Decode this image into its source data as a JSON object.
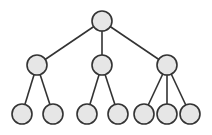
{
  "diagram": {
    "type": "tree",
    "style": {
      "node_fill": "#e6e6e6",
      "node_stroke": "#333333",
      "edge_color": "#333333",
      "background": "#ffffff",
      "node_radius": 10
    },
    "nodes": [
      {
        "id": "root",
        "level": 0,
        "cx": 102,
        "cy": 21
      },
      {
        "id": "a",
        "level": 1,
        "cx": 37,
        "cy": 65
      },
      {
        "id": "b",
        "level": 1,
        "cx": 102,
        "cy": 65
      },
      {
        "id": "c",
        "level": 1,
        "cx": 167,
        "cy": 65
      },
      {
        "id": "a1",
        "level": 2,
        "cx": 22,
        "cy": 114
      },
      {
        "id": "a2",
        "level": 2,
        "cx": 53,
        "cy": 114
      },
      {
        "id": "b1",
        "level": 2,
        "cx": 87,
        "cy": 114
      },
      {
        "id": "b2",
        "level": 2,
        "cx": 118,
        "cy": 114
      },
      {
        "id": "c1",
        "level": 2,
        "cx": 144,
        "cy": 114
      },
      {
        "id": "c2",
        "level": 2,
        "cx": 167,
        "cy": 114
      },
      {
        "id": "c3",
        "level": 2,
        "cx": 190,
        "cy": 114
      }
    ],
    "edges": [
      {
        "from": "root",
        "to": "a"
      },
      {
        "from": "root",
        "to": "b"
      },
      {
        "from": "root",
        "to": "c"
      },
      {
        "from": "a",
        "to": "a1"
      },
      {
        "from": "a",
        "to": "a2"
      },
      {
        "from": "b",
        "to": "b1"
      },
      {
        "from": "b",
        "to": "b2"
      },
      {
        "from": "c",
        "to": "c1"
      },
      {
        "from": "c",
        "to": "c2"
      },
      {
        "from": "c",
        "to": "c3"
      }
    ]
  }
}
